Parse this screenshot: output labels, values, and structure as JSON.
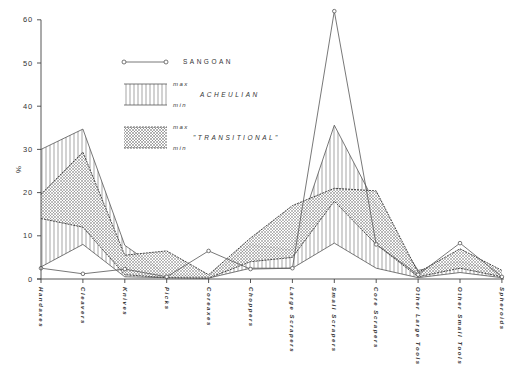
{
  "chart_data": {
    "type": "line",
    "title": "",
    "xlabel": "",
    "ylabel": "%",
    "ylim": [
      0,
      60
    ],
    "yticks": [
      0,
      10,
      20,
      30,
      40,
      50,
      60
    ],
    "grid": false,
    "legend_position": "upper-left-inside",
    "categories": [
      "Handaxes",
      "Cleavers",
      "Knives",
      "Picks",
      "Coreaxes",
      "Choppers",
      "Large Scrapers",
      "Small Scrapers",
      "Core Scrapers",
      "Other Large Tools",
      "Other Small Tools",
      "Spheroids"
    ],
    "series": [
      {
        "name": "SANGOAN",
        "style": "line-open-circles",
        "values": [
          2.5,
          1.2,
          2.3,
          0.5,
          6.5,
          2.3,
          2.5,
          62,
          8,
          1,
          8.3,
          0.5
        ]
      },
      {
        "name": "ACHEULIAN max",
        "style": "band-vertical-hatch-upper",
        "values": [
          30,
          34.7,
          7.8,
          1,
          0.5,
          7.9,
          6.7,
          35.6,
          17,
          2,
          4,
          1.5
        ]
      },
      {
        "name": "ACHEULIAN min",
        "style": "band-vertical-hatch-lower",
        "values": [
          2.8,
          8,
          0.5,
          0.3,
          0.2,
          2.5,
          2.5,
          8.3,
          2.5,
          0.3,
          1.5,
          0.3
        ]
      },
      {
        "name": "\"TRANSITIONAL\" max",
        "style": "band-dotted-upper",
        "values": [
          19.6,
          29.4,
          5.5,
          6.5,
          1,
          9.5,
          17,
          21,
          20.4,
          1.5,
          7,
          2
        ]
      },
      {
        "name": "\"TRANSITIONAL\" min",
        "style": "band-dotted-lower",
        "values": [
          14,
          12,
          1,
          0.3,
          0.2,
          4,
          5,
          18,
          8,
          0.5,
          2.5,
          0.5
        ]
      }
    ],
    "legend": {
      "sangoan": "SANGOAN",
      "acheulian": "ACHEULIAN",
      "transitional": "\"TRANSITIONAL\"",
      "max": "max",
      "min": "min"
    }
  }
}
